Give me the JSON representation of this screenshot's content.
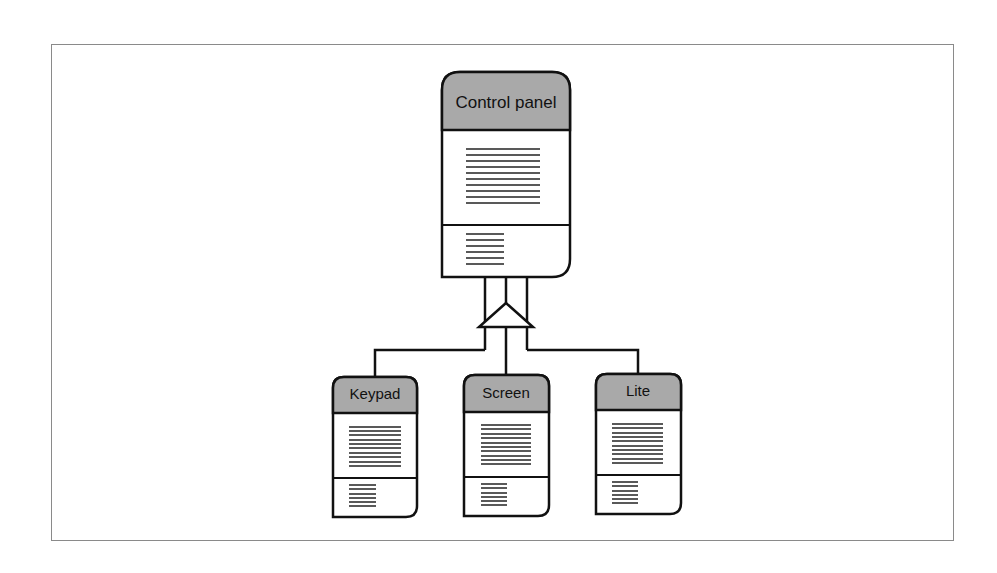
{
  "diagram": {
    "type": "class-inheritance",
    "parent": {
      "label": "Control panel",
      "header_color": "#a9a9a9"
    },
    "children": [
      {
        "label": "Keypad",
        "header_color": "#a9a9a9"
      },
      {
        "label": "Screen",
        "header_color": "#a9a9a9"
      },
      {
        "label": "Lite",
        "header_color": "#a9a9a9"
      }
    ],
    "connector": "generalization-triangle",
    "colors": {
      "stroke": "#111111",
      "frame": "#8a8a8a",
      "background": "#ffffff"
    }
  }
}
